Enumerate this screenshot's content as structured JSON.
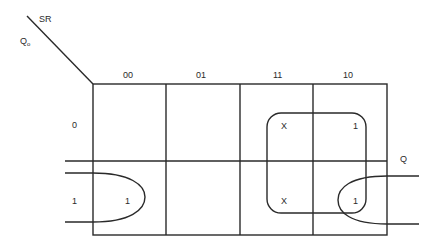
{
  "diagram": {
    "type": "karnaugh-map",
    "corner": {
      "col_var": "SR",
      "row_var": "Q",
      "row_var_subscript": "o"
    },
    "column_headers": [
      "00",
      "01",
      "11",
      "10"
    ],
    "row_headers": [
      "0",
      "1"
    ],
    "cells": [
      [
        "",
        "",
        "X",
        "1"
      ],
      [
        "1",
        "",
        "X",
        "1"
      ]
    ],
    "output_label": "Q",
    "groups": [
      {
        "name": "S-group",
        "cells": "columns 11,10 (rows 0,1)"
      },
      {
        "name": "wrap-group",
        "cells": "row 1, columns 00 and 10 (wraparound)"
      }
    ]
  }
}
